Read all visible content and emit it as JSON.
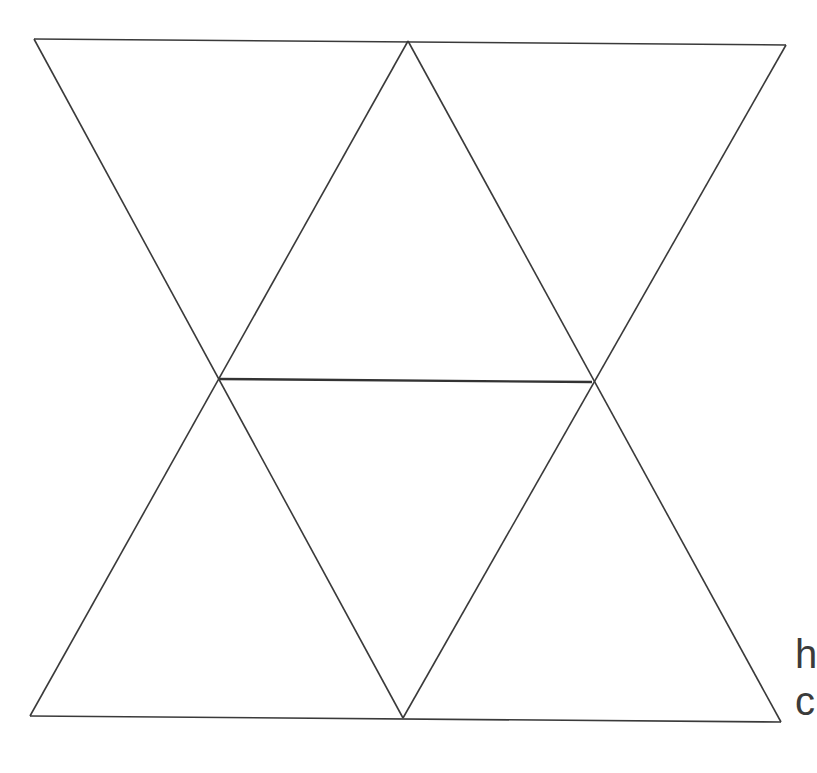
{
  "page": {
    "background_color": "#ffffff",
    "width": 813,
    "height": 773
  },
  "figure": {
    "name": "triangular-lattice",
    "stroke_color": "#3a3a3a",
    "stroke_color_emphasis": "#333333",
    "stroke_width": 1.6,
    "stroke_width_emphasis": 2.4,
    "fill": "none"
  },
  "vertices": [
    {
      "id": "top-left",
      "label": "A",
      "x": 34,
      "y": 39
    },
    {
      "id": "top-middle",
      "label": "B",
      "x": 408,
      "y": 41
    },
    {
      "id": "top-right",
      "label": "C",
      "x": 786,
      "y": 45
    },
    {
      "id": "middle-left",
      "label": "D",
      "x": 218,
      "y": 379
    },
    {
      "id": "middle-right",
      "label": "E",
      "x": 592,
      "y": 382
    },
    {
      "id": "bottom-left",
      "label": "F",
      "x": 30,
      "y": 716
    },
    {
      "id": "bottom-middle",
      "label": "G",
      "x": 403,
      "y": 718
    },
    {
      "id": "bottom-right",
      "label": "H",
      "x": 781,
      "y": 722
    }
  ],
  "edges": [
    {
      "id": "edge-top",
      "from": "top-left",
      "to": "top-right",
      "emphasis": false
    },
    {
      "id": "edge-bottom",
      "from": "bottom-left",
      "to": "bottom-right",
      "emphasis": false
    },
    {
      "id": "edge-middle-horizontal",
      "from": "middle-left",
      "to": "middle-right",
      "emphasis": true
    },
    {
      "id": "edge-a-to-g",
      "from": "top-left",
      "to": "bottom-middle",
      "emphasis": false
    },
    {
      "id": "edge-b-to-f",
      "from": "top-middle",
      "to": "bottom-left",
      "emphasis": false
    },
    {
      "id": "edge-b-to-h",
      "from": "top-middle",
      "to": "bottom-right",
      "emphasis": false
    },
    {
      "id": "edge-c-to-g",
      "from": "top-right",
      "to": "bottom-middle",
      "emphasis": false
    }
  ],
  "clipped_text": {
    "note": "Text clipped at right image edge",
    "line_1": "h",
    "line_2": "c"
  }
}
